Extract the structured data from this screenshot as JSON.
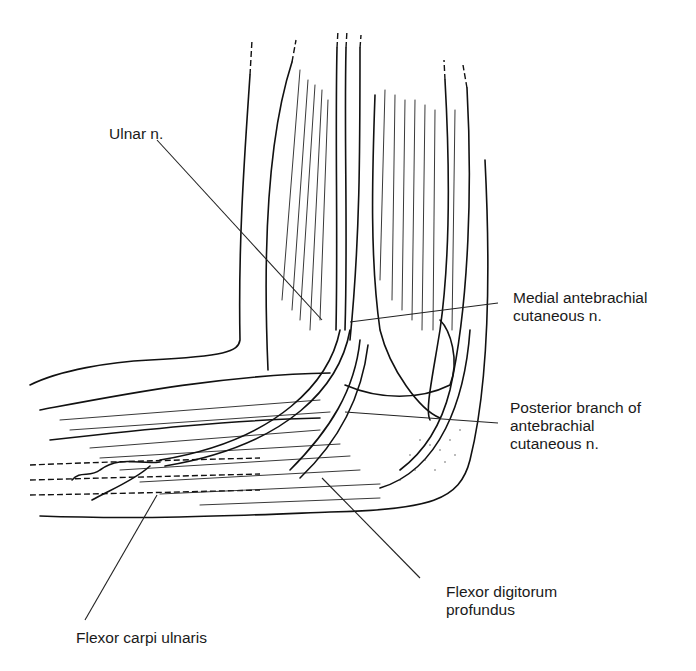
{
  "figure": {
    "labels": [
      {
        "id": "ulnar-n",
        "text": "Ulnar n.",
        "x": 109,
        "y": 125
      },
      {
        "id": "medial-antebrachial",
        "text": "Medial antebrachial\ncutaneous n.",
        "x": 513,
        "y": 289
      },
      {
        "id": "posterior-branch",
        "text": "Posterior branch of\nantebrachial\ncutaneous n.",
        "x": 510,
        "y": 399
      },
      {
        "id": "flexor-digitorum",
        "text": "Flexor digitorum\nprofundus",
        "x": 446,
        "y": 583
      },
      {
        "id": "flexor-carpi",
        "text": "Flexor carpi ulnaris",
        "x": 76,
        "y": 629
      }
    ],
    "leaders": [
      {
        "id": "ulnar-n",
        "x1": 157,
        "y1": 140,
        "x2": 322,
        "y2": 320
      },
      {
        "id": "medial-antebrachial",
        "x1": 498,
        "y1": 303,
        "x2": 350,
        "y2": 322
      },
      {
        "id": "posterior-branch",
        "x1": 498,
        "y1": 423,
        "x2": 345,
        "y2": 412
      },
      {
        "id": "flexor-digitorum",
        "x1": 420,
        "y1": 578,
        "x2": 322,
        "y2": 478
      },
      {
        "id": "flexor-carpi",
        "x1": 85,
        "y1": 620,
        "x2": 157,
        "y2": 495
      }
    ]
  }
}
